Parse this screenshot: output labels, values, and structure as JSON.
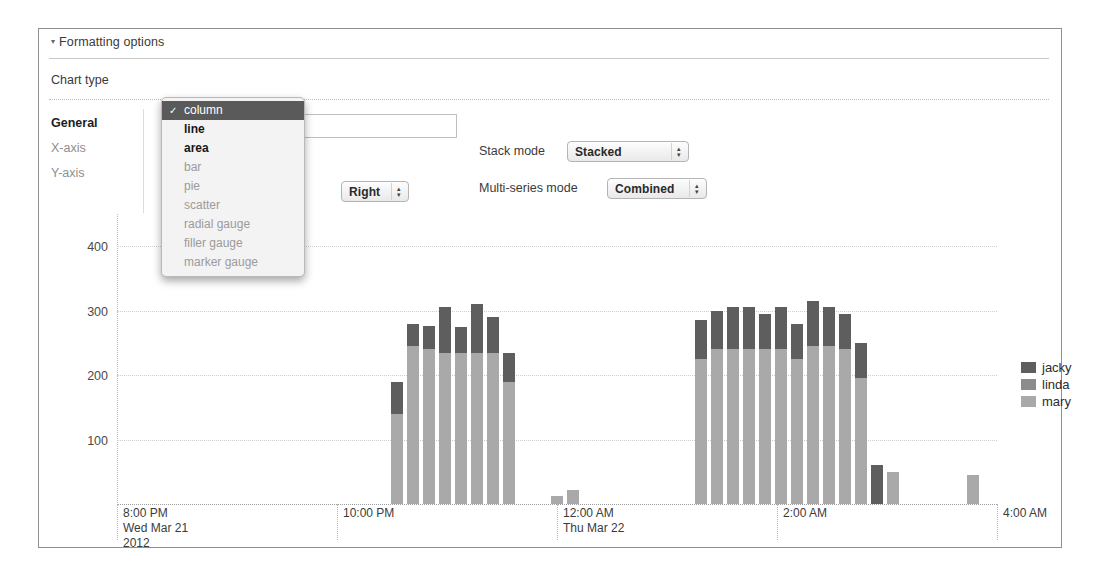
{
  "panel": {
    "header": "Formatting options",
    "collapse_glyph": "▾"
  },
  "chart_type": {
    "label": "Chart type",
    "selected": "column",
    "check_glyph": "✓",
    "options": [
      {
        "label": "column",
        "state": "selected"
      },
      {
        "label": "line",
        "state": "enabled"
      },
      {
        "label": "area",
        "state": "enabled"
      },
      {
        "label": "bar",
        "state": "disabled"
      },
      {
        "label": "pie",
        "state": "disabled"
      },
      {
        "label": "scatter",
        "state": "disabled"
      },
      {
        "label": "radial gauge",
        "state": "disabled"
      },
      {
        "label": "filler gauge",
        "state": "disabled"
      },
      {
        "label": "marker gauge",
        "state": "disabled"
      }
    ]
  },
  "tabs": [
    {
      "label": "General",
      "state": "active"
    },
    {
      "label": "X-axis",
      "state": "inactive"
    },
    {
      "label": "Y-axis",
      "state": "inactive"
    }
  ],
  "fields": {
    "title_value": "",
    "title_placeholder": "",
    "legend_placement_label": "cement",
    "legend_placement_value": "Right",
    "stack_mode_label": "Stack mode",
    "stack_mode_value": "Stacked",
    "multi_series_label": "Multi-series mode",
    "multi_series_value": "Combined",
    "stepper_glyph_up": "▴",
    "stepper_glyph_down": "▾"
  },
  "chart_data": {
    "type": "bar",
    "subtype": "stacked-column",
    "title": "",
    "xlabel": "",
    "ylabel": "",
    "ylim": [
      0,
      450
    ],
    "yticks": [
      100,
      200,
      300,
      400
    ],
    "grid": true,
    "legend_position": "right",
    "x_axis_ticks": [
      {
        "l1": "8:00 PM",
        "l2": "Wed Mar 21",
        "l3": "2012"
      },
      {
        "l1": "10:00 PM",
        "l2": "",
        "l3": ""
      },
      {
        "l1": "12:00 AM",
        "l2": "Thu Mar 22",
        "l3": ""
      },
      {
        "l1": "2:00 AM",
        "l2": "",
        "l3": ""
      },
      {
        "l1": "4:00 AM",
        "l2": "",
        "l3": ""
      }
    ],
    "x_tick_positions_pct": [
      0,
      25,
      50,
      75,
      100
    ],
    "colors": {
      "jacky": "#5e5e5e",
      "linda": "#8c8c8c",
      "mary": "#a9a9a9"
    },
    "series": [
      {
        "name": "jacky",
        "values": [
          0,
          0,
          0,
          0,
          0,
          0,
          0,
          0,
          0,
          0,
          0,
          0,
          0,
          0,
          0,
          0,
          0,
          50,
          35,
          36,
          70,
          40,
          75,
          55,
          45,
          0,
          0,
          0,
          0,
          0,
          0,
          0,
          0,
          0,
          0,
          0,
          60,
          60,
          65,
          65,
          55,
          65,
          55,
          70,
          60,
          55,
          55,
          60,
          0,
          0,
          0,
          0,
          0,
          0,
          0
        ]
      },
      {
        "name": "linda",
        "values": [
          0,
          0,
          0,
          0,
          0,
          0,
          0,
          0,
          0,
          0,
          0,
          0,
          0,
          0,
          0,
          0,
          0,
          0,
          0,
          0,
          0,
          0,
          0,
          0,
          0,
          0,
          0,
          0,
          0,
          0,
          0,
          0,
          0,
          0,
          0,
          0,
          0,
          0,
          0,
          0,
          0,
          0,
          0,
          0,
          0,
          0,
          0,
          0,
          0,
          0,
          0,
          0,
          0,
          0,
          0
        ]
      },
      {
        "name": "mary",
        "values": [
          0,
          0,
          0,
          0,
          0,
          0,
          0,
          0,
          0,
          0,
          0,
          0,
          0,
          0,
          0,
          0,
          0,
          140,
          245,
          240,
          235,
          235,
          235,
          235,
          190,
          0,
          0,
          12,
          22,
          0,
          0,
          0,
          0,
          0,
          0,
          0,
          225,
          240,
          240,
          240,
          240,
          240,
          225,
          245,
          245,
          240,
          195,
          0,
          50,
          0,
          0,
          0,
          0,
          45,
          0
        ]
      }
    ],
    "totals": [
      0,
      0,
      0,
      0,
      0,
      0,
      0,
      0,
      0,
      0,
      0,
      0,
      0,
      0,
      0,
      0,
      0,
      190,
      280,
      276,
      305,
      275,
      310,
      290,
      235,
      0,
      0,
      12,
      22,
      0,
      0,
      0,
      0,
      0,
      0,
      0,
      285,
      300,
      305,
      305,
      295,
      305,
      280,
      315,
      305,
      295,
      250,
      60,
      50,
      0,
      0,
      0,
      0,
      45,
      0
    ],
    "bar_count": 55
  },
  "legend": {
    "items": [
      {
        "label": "jacky",
        "color": "#5e5e5e"
      },
      {
        "label": "linda",
        "color": "#8c8c8c"
      },
      {
        "label": "mary",
        "color": "#a9a9a9"
      }
    ]
  }
}
